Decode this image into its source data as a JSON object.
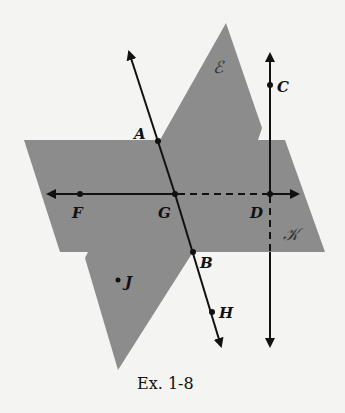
{
  "figure": {
    "caption": "Ex. 1-8",
    "planes": [
      {
        "name": "E",
        "label": "ℰ"
      },
      {
        "name": "K",
        "label": "𝒦"
      }
    ],
    "points": [
      {
        "name": "A",
        "label": "A"
      },
      {
        "name": "B",
        "label": "B"
      },
      {
        "name": "C",
        "label": "C"
      },
      {
        "name": "D",
        "label": "D"
      },
      {
        "name": "F",
        "label": "F"
      },
      {
        "name": "G",
        "label": "G"
      },
      {
        "name": "H",
        "label": "H"
      },
      {
        "name": "J",
        "label": "J"
      }
    ],
    "lines": [
      "line FD (horizontal, dashed between G and D)",
      "line AB through G and H",
      "line CD (vertical, dashed below D inside plane K)"
    ],
    "colors": {
      "plane": "#8c8c8c",
      "ink": "#111111",
      "background": "#f4f4f2"
    }
  }
}
